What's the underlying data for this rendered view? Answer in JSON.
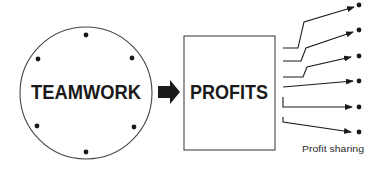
{
  "diagram": {
    "source": {
      "label": "TEAMWORK",
      "shape": "circle",
      "member_dots": 6
    },
    "connector": {
      "type": "block-arrow",
      "direction": "right"
    },
    "target": {
      "label": "PROFITS",
      "shape": "rectangle"
    },
    "distribution": {
      "branch_count": 6,
      "caption": "Profit sharing"
    }
  },
  "colors": {
    "stroke": "#444444",
    "text": "#1a1a1a",
    "background": "#ffffff"
  }
}
